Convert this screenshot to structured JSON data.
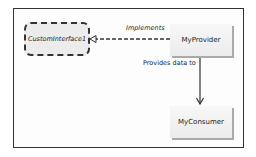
{
  "diagram": {
    "nodes": [
      {
        "id": "iface",
        "label": "CustomInterface1",
        "kind": "interface"
      },
      {
        "id": "provider",
        "label": "MyProvider",
        "kind": "class"
      },
      {
        "id": "consumer",
        "label": "MyConsumer",
        "kind": "class"
      }
    ],
    "edges": [
      {
        "from": "provider",
        "to": "iface",
        "label": "Implements",
        "style": "dashed",
        "arrow": "hollow-triangle"
      },
      {
        "from": "provider",
        "to": "consumer",
        "label": "Provides data to",
        "style": "solid",
        "arrow": "open"
      }
    ],
    "colors": {
      "border": "#333333",
      "node_fill": "#ececec",
      "shadow": "#aaaaaa"
    }
  }
}
